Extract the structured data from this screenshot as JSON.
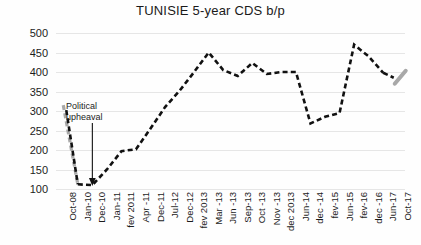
{
  "chart_data": {
    "type": "line",
    "title": "TUNISIE 5-year CDS b/p",
    "xlabel": "",
    "ylabel": "",
    "ylim": [
      100,
      500
    ],
    "ytick_step": 50,
    "yticks": [
      500,
      450,
      400,
      350,
      300,
      250,
      200,
      150,
      100
    ],
    "grid": true,
    "legend": "none",
    "line_style": "dashed",
    "line_color": "#111111",
    "endpoint_color": "#a8a8a8",
    "categories": [
      "Oct-08",
      "Jan-10",
      "Dec-10",
      "Jan-11",
      "fev 2011",
      "Apr -11",
      "Dec-11",
      "Jul-12",
      "Dec-12",
      "fev 2013",
      "Mar -13",
      "Jun -13",
      "Sep-13",
      "Oct -13",
      "Nov -13",
      "dec 2013",
      "Jun-14",
      "dec -14",
      "fev-15",
      "Jun-15",
      "fev-16",
      "dec -16",
      "Jun-17",
      "Oct-17"
    ],
    "values": [
      315,
      112,
      110,
      150,
      197,
      202,
      255,
      310,
      352,
      400,
      450,
      405,
      390,
      423,
      395,
      400,
      400,
      268,
      285,
      295,
      470,
      440,
      398,
      375
    ],
    "annotations": [
      {
        "text": "Political\nupheaval",
        "points_to_category": "Dec-10",
        "points_to_value": 110
      }
    ]
  }
}
